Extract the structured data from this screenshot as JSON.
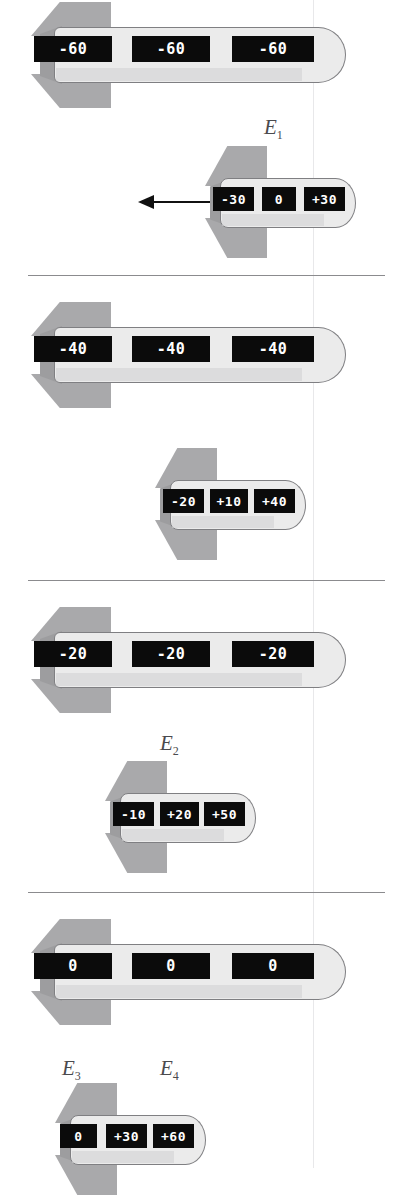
{
  "figure": {
    "type": "physics-diagram",
    "panel_count": 4
  },
  "colors": {
    "body_fill": "#ebebeb",
    "body_outline": "#7f7f82",
    "fin_fill": "#a9a9ab",
    "display_bg": "#0b0b0b",
    "display_text": "#ffffff",
    "divider": "#8b8b8e",
    "label_text": "#4a4a4d",
    "arrow": "#111111",
    "scanline": "#e8e8ea"
  },
  "panels": [
    {
      "id": "panel-1",
      "big_rocket": {
        "name": "large-rocket",
        "displays": [
          "-60",
          "-60",
          "-60"
        ]
      },
      "small_rocket": {
        "name": "small-rocket",
        "displays": [
          "-30",
          "0",
          "+30"
        ]
      },
      "labels": [
        {
          "name": "label-e1",
          "text": "E",
          "sub": "1"
        }
      ],
      "arrow": {
        "name": "velocity-arrow",
        "direction": "left"
      }
    },
    {
      "id": "panel-2",
      "big_rocket": {
        "name": "large-rocket",
        "displays": [
          "-40",
          "-40",
          "-40"
        ]
      },
      "small_rocket": {
        "name": "small-rocket",
        "displays": [
          "-20",
          "+10",
          "+40"
        ]
      },
      "labels": [],
      "arrow": null
    },
    {
      "id": "panel-3",
      "big_rocket": {
        "name": "large-rocket",
        "displays": [
          "-20",
          "-20",
          "-20"
        ]
      },
      "small_rocket": {
        "name": "small-rocket",
        "displays": [
          "-10",
          "+20",
          "+50"
        ]
      },
      "labels": [
        {
          "name": "label-e2",
          "text": "E",
          "sub": "2"
        }
      ],
      "arrow": null
    },
    {
      "id": "panel-4",
      "big_rocket": {
        "name": "large-rocket",
        "displays": [
          "0",
          "0",
          "0"
        ]
      },
      "small_rocket": {
        "name": "small-rocket",
        "displays": [
          "0",
          "+30",
          "+60"
        ]
      },
      "labels": [
        {
          "name": "label-e3",
          "text": "E",
          "sub": "3"
        },
        {
          "name": "label-e4",
          "text": "E",
          "sub": "4"
        }
      ],
      "arrow": null
    }
  ]
}
